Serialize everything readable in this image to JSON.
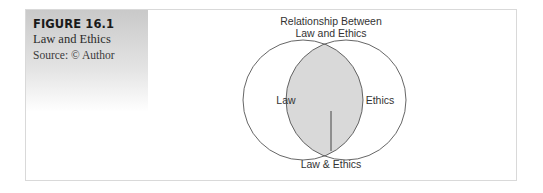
{
  "figure": {
    "label": "FIGURE 16.1",
    "title": "Law and Ethics",
    "source": "Source: © Author"
  },
  "diagram": {
    "type": "venn",
    "title_line1": "Relationship Between",
    "title_line2": "Law and Ethics",
    "left_set": "Law",
    "right_set": "Ethics",
    "intersection": "Law & Ethics",
    "colors": {
      "stroke": "#555555",
      "intersection_fill": "#d9d9d9",
      "sidebar_top": "#c9c9c9"
    }
  }
}
